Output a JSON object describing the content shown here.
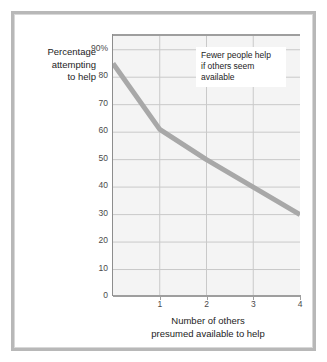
{
  "chart_data": {
    "type": "line",
    "title": "",
    "subtitle": "",
    "xlabel": "Number of others presumed available to help",
    "xlabel_lines": [
      "Number of others",
      "presumed available to help"
    ],
    "ylabel": "Percentage attempting to help",
    "ylabel_lines": [
      "Percentage",
      "attempting",
      "to help"
    ],
    "x": [
      0,
      1,
      2,
      3,
      4
    ],
    "values": [
      85,
      61,
      50,
      40,
      30
    ],
    "series": [
      {
        "name": "Percentage attempting to help",
        "values": [
          85,
          61,
          50,
          40,
          30
        ],
        "color": "#a8a8a8"
      }
    ],
    "xlim": [
      0,
      4
    ],
    "ylim": [
      0,
      95
    ],
    "xticks": [
      1,
      2,
      3,
      4
    ],
    "xtick_labels": [
      "1",
      "2",
      "3",
      "4"
    ],
    "yticks": [
      0,
      10,
      20,
      30,
      40,
      50,
      60,
      70,
      80,
      90
    ],
    "ytick_labels": [
      "0",
      "10",
      "20",
      "30",
      "40",
      "50",
      "60",
      "70",
      "80",
      "90%"
    ],
    "grid": true,
    "grid_x": true,
    "grid_y": true,
    "legend": false,
    "legend_position": "none",
    "annotations": [
      {
        "lines": [
          "Fewer people help",
          "if others seem",
          "available"
        ],
        "text": "Fewer people help if others seem available"
      }
    ]
  },
  "style": {
    "line_color": "#a8a8a8",
    "plot_background": "#f4f4f4",
    "grid_color": "#c9c9c9",
    "axis_color": "#9e9e9e",
    "text_color": "#1d1d1d",
    "tick_color": "#4a4a4a",
    "frame_color": "#b8b8b8",
    "page_background": "#ffffff",
    "annotation_background": "#ffffff"
  }
}
